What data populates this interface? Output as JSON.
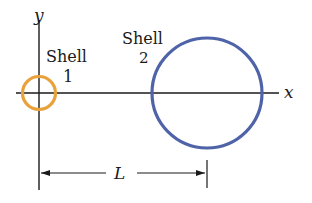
{
  "diagram": {
    "axes": {
      "x_label": "x",
      "y_label": "y"
    },
    "shells": [
      {
        "name": "Shell 1",
        "label_line1": "Shell",
        "label_line2": "1",
        "color": "#e9a23b",
        "cx": 39,
        "cy": 93,
        "r": 17
      },
      {
        "name": "Shell 2",
        "label_line1": "Shell",
        "label_line2": "2",
        "color": "#4f63a8",
        "cx": 207,
        "cy": 93,
        "r": 55
      }
    ],
    "dimension": {
      "label": "L",
      "from_x": 39,
      "to_x": 207
    }
  }
}
